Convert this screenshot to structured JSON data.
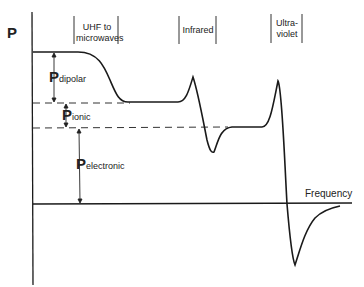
{
  "diagram": {
    "y_axis_label": "P",
    "x_axis_label": "Frequency",
    "regions": [
      {
        "label_line1": "UHF to",
        "label_line2": "microwaves"
      },
      {
        "label_line1": "Infrared",
        "label_line2": ""
      },
      {
        "label_line1": "Ultra-",
        "label_line2": "violet"
      }
    ],
    "components": [
      {
        "symbol": "P",
        "subscript": "dipolar"
      },
      {
        "symbol": "P",
        "subscript": "ionic"
      },
      {
        "symbol": "P",
        "subscript": "electronic"
      }
    ],
    "colors": {
      "line": "#1a1a1a",
      "background": "#ffffff"
    }
  }
}
